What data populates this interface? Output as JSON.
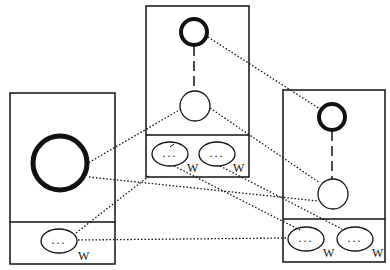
{
  "diagram": {
    "ink_color": "#111111",
    "background": "#ffffff",
    "panels": [
      {
        "id": "left",
        "nodes": [
          {
            "type": "thick-circle",
            "size": "large"
          }
        ],
        "ovals": [
          {
            "dots": "...",
            "label": "W"
          }
        ]
      },
      {
        "id": "middle",
        "nodes": [
          {
            "type": "thick-circle",
            "size": "small"
          },
          {
            "type": "thin-circle"
          }
        ],
        "edge": "dashed",
        "ovals": [
          {
            "dots": "...",
            "label": "W"
          },
          {
            "dots": "...",
            "label": "W"
          }
        ]
      },
      {
        "id": "right",
        "nodes": [
          {
            "type": "thick-circle",
            "size": "small"
          },
          {
            "type": "thin-circle"
          }
        ],
        "edge": "dashed",
        "ovals": [
          {
            "dots": "...",
            "label": "W"
          },
          {
            "dots": "...",
            "label": "W"
          }
        ]
      }
    ],
    "connections_style": "dotted",
    "connections_count": 8
  }
}
